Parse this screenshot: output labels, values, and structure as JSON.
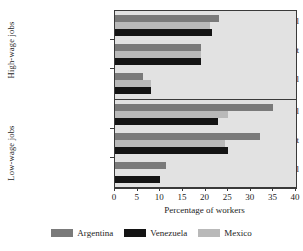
{
  "chart_data": {
    "type": "bar",
    "orientation": "horizontal",
    "title": "",
    "xlabel": "Percentage of workers",
    "ylabel": "",
    "xlim": [
      0,
      40
    ],
    "xticks": [
      0,
      5,
      10,
      15,
      20,
      25,
      30,
      35,
      40
    ],
    "grid": false,
    "legend_position": "bottom",
    "panels": [
      {
        "name": "High-wage jobs",
        "categories": [
          "Informal",
          "Self-Employment",
          "Formal"
        ],
        "series": [
          {
            "name": "Argentina",
            "color": "#7a7a7a",
            "values": [
              23.0,
              19.0,
              6.2
            ]
          },
          {
            "name": "Mexico",
            "color": "#b9b9b9",
            "values": [
              21.0,
              19.0,
              8.0
            ]
          },
          {
            "name": "Venezuela",
            "color": "#141414",
            "values": [
              21.5,
              19.0,
              8.0
            ]
          }
        ]
      },
      {
        "name": "Low-wage jobs",
        "categories": [
          "Informal",
          "Self-Employment",
          "Formal"
        ],
        "series": [
          {
            "name": "Argentina",
            "color": "#7a7a7a",
            "values": [
              35.0,
              32.0,
              11.3
            ]
          },
          {
            "name": "Mexico",
            "color": "#b9b9b9",
            "values": [
              25.0,
              24.2,
              0.0
            ]
          },
          {
            "name": "Venezuela",
            "color": "#141414",
            "values": [
              22.8,
              25.0,
              10.0
            ]
          }
        ]
      }
    ],
    "legend": [
      {
        "label": "Argentina",
        "color": "#7a7a7a"
      },
      {
        "label": "Venezuela",
        "color": "#141414"
      },
      {
        "label": "Mexico",
        "color": "#b9b9b9"
      }
    ]
  },
  "axis": {
    "xlabel": "Percentage of workers",
    "ticks": [
      "0",
      "5",
      "10",
      "15",
      "20",
      "25",
      "30",
      "35",
      "40"
    ]
  },
  "panels": {
    "high": {
      "label": "High-wage jobs",
      "categories": [
        "Informal",
        "Self-Employment",
        "Formal"
      ]
    },
    "low": {
      "label": "Low-wage jobs",
      "categories": [
        "Informal",
        "Self-Employment",
        "Formal"
      ]
    }
  },
  "legend": {
    "items": [
      {
        "label": "Argentina"
      },
      {
        "label": "Venezuela"
      },
      {
        "label": "Mexico"
      }
    ]
  }
}
